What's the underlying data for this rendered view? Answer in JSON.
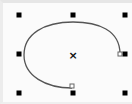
{
  "canvas": {
    "width": 132,
    "height": 104,
    "background": "#fbfbfb"
  },
  "selection": {
    "handle_color": "#000000",
    "handle_size": 5,
    "handles": [
      {
        "id": "top-left",
        "x": 19,
        "y": 15
      },
      {
        "id": "top-center",
        "x": 73,
        "y": 15
      },
      {
        "id": "top-right",
        "x": 125,
        "y": 15
      },
      {
        "id": "middle-left",
        "x": 19,
        "y": 54
      },
      {
        "id": "middle-right",
        "x": 125,
        "y": 54
      },
      {
        "id": "bottom-left",
        "x": 19,
        "y": 93
      },
      {
        "id": "bottom-center",
        "x": 73,
        "y": 93
      },
      {
        "id": "bottom-right",
        "x": 125,
        "y": 93
      }
    ],
    "center_marker": {
      "symbol": "×",
      "x": 73,
      "y": 56
    }
  },
  "shape": {
    "type": "elliptical-arc",
    "stroke": "#555555",
    "stroke_width": 1.3,
    "path": "M 120 54 C 120 30, 98 22, 73 22 C 44 22, 24 34, 24 55 C 24 76, 46 88, 72 88",
    "start_node": {
      "x": 120,
      "y": 54
    },
    "end_node": {
      "x": 72,
      "y": 88
    }
  }
}
